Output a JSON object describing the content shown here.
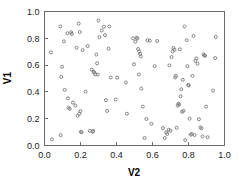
{
  "chart_data": {
    "type": "scatter",
    "title": "",
    "xlabel": "V2",
    "ylabel": "V1",
    "xlim": [
      0.0,
      1.0
    ],
    "ylim": [
      0.0,
      1.0
    ],
    "grid": false,
    "legend": null,
    "marker": "open-circle",
    "marker_color": "#777777",
    "xticks": [
      0.0,
      0.2,
      0.4,
      0.6,
      0.8,
      1.0
    ],
    "xtick_labels": [
      "0.0",
      "0.2",
      "0.4",
      "0.6",
      "0.8",
      "1.0"
    ],
    "yticks": [
      0.0,
      0.2,
      0.4,
      0.6,
      0.8,
      1.0
    ],
    "ytick_labels": [
      "0.0",
      "0.2",
      "0.4",
      "0.6",
      "0.8",
      "1.0"
    ],
    "n_points": 120,
    "points": [
      [
        0.036,
        0.695
      ],
      [
        0.041,
        0.046
      ],
      [
        0.088,
        0.888
      ],
      [
        0.09,
        0.077
      ],
      [
        0.093,
        0.512
      ],
      [
        0.098,
        0.588
      ],
      [
        0.108,
        0.777
      ],
      [
        0.112,
        0.415
      ],
      [
        0.127,
        0.838
      ],
      [
        0.13,
        0.352
      ],
      [
        0.134,
        0.282
      ],
      [
        0.14,
        0.273
      ],
      [
        0.148,
        0.845
      ],
      [
        0.152,
        0.833
      ],
      [
        0.158,
        0.32
      ],
      [
        0.172,
        0.298
      ],
      [
        0.178,
        0.729
      ],
      [
        0.184,
        0.222
      ],
      [
        0.19,
        0.91
      ],
      [
        0.194,
        0.238
      ],
      [
        0.196,
        0.847
      ],
      [
        0.199,
        0.256
      ],
      [
        0.202,
        0.103
      ],
      [
        0.206,
        0.099
      ],
      [
        0.212,
        0.712
      ],
      [
        0.228,
        0.402
      ],
      [
        0.24,
        0.742
      ],
      [
        0.252,
        0.11
      ],
      [
        0.263,
        0.566
      ],
      [
        0.268,
        0.103
      ],
      [
        0.27,
        0.108
      ],
      [
        0.272,
        0.552
      ],
      [
        0.276,
        0.545
      ],
      [
        0.282,
        0.532
      ],
      [
        0.288,
        0.679
      ],
      [
        0.292,
        0.613
      ],
      [
        0.296,
        0.529
      ],
      [
        0.3,
        0.933
      ],
      [
        0.305,
        0.808
      ],
      [
        0.318,
        0.858
      ],
      [
        0.33,
        0.886
      ],
      [
        0.336,
        0.824
      ],
      [
        0.341,
        0.338
      ],
      [
        0.348,
        0.258
      ],
      [
        0.356,
        0.723
      ],
      [
        0.36,
        0.888
      ],
      [
        0.368,
        0.508
      ],
      [
        0.396,
        0.343
      ],
      [
        0.404,
        0.506
      ],
      [
        0.452,
        0.47
      ],
      [
        0.458,
        0.237
      ],
      [
        0.492,
        0.799
      ],
      [
        0.497,
        0.606
      ],
      [
        0.505,
        0.775
      ],
      [
        0.512,
        0.805
      ],
      [
        0.516,
        0.798
      ],
      [
        0.52,
        0.72
      ],
      [
        0.524,
        0.53
      ],
      [
        0.527,
        0.7
      ],
      [
        0.531,
        0.684
      ],
      [
        0.535,
        0.665
      ],
      [
        0.538,
        0.425
      ],
      [
        0.546,
        0.29
      ],
      [
        0.556,
        0.056
      ],
      [
        0.566,
        0.198
      ],
      [
        0.572,
        0.786
      ],
      [
        0.585,
        0.782
      ],
      [
        0.594,
        0.162
      ],
      [
        0.612,
        0.592
      ],
      [
        0.626,
        0.78
      ],
      [
        0.658,
        0.13
      ],
      [
        0.668,
        0.056
      ],
      [
        0.676,
        0.098
      ],
      [
        0.682,
        0.086
      ],
      [
        0.69,
        0.118
      ],
      [
        0.694,
        0.598
      ],
      [
        0.7,
        0.11
      ],
      [
        0.706,
        0.66
      ],
      [
        0.712,
        0.702
      ],
      [
        0.716,
        0.728
      ],
      [
        0.722,
        0.714
      ],
      [
        0.726,
        0.508
      ],
      [
        0.73,
        0.52
      ],
      [
        0.734,
        0.132
      ],
      [
        0.74,
        0.298
      ],
      [
        0.744,
        0.312
      ],
      [
        0.748,
        0.306
      ],
      [
        0.752,
        0.718
      ],
      [
        0.756,
        0.368
      ],
      [
        0.76,
        0.42
      ],
      [
        0.764,
        0.252
      ],
      [
        0.768,
        0.49
      ],
      [
        0.772,
        0.258
      ],
      [
        0.778,
        0.888
      ],
      [
        0.782,
        0.04
      ],
      [
        0.79,
        0.786
      ],
      [
        0.794,
        0.592
      ],
      [
        0.798,
        0.452
      ],
      [
        0.802,
        0.448
      ],
      [
        0.806,
        0.2
      ],
      [
        0.812,
        0.08
      ],
      [
        0.818,
        0.086
      ],
      [
        0.822,
        0.52
      ],
      [
        0.828,
        0.818
      ],
      [
        0.834,
        0.078
      ],
      [
        0.838,
        0.632
      ],
      [
        0.844,
        0.65
      ],
      [
        0.85,
        0.61
      ],
      [
        0.858,
        0.196
      ],
      [
        0.866,
        0.135
      ],
      [
        0.872,
        0.128
      ],
      [
        0.878,
        0.068
      ],
      [
        0.884,
        0.68
      ],
      [
        0.888,
        0.672
      ],
      [
        0.892,
        0.67
      ],
      [
        0.898,
        0.29
      ],
      [
        0.906,
        0.062
      ],
      [
        0.936,
        0.41
      ],
      [
        0.948,
        0.652
      ],
      [
        0.952,
        0.81
      ]
    ]
  }
}
